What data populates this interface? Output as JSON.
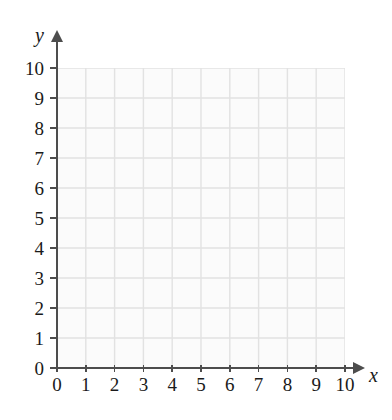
{
  "chart_data": {
    "type": "scatter",
    "title": "",
    "subtitle": "",
    "xlabel": "x",
    "ylabel": "y",
    "xlim": [
      0,
      10
    ],
    "ylim": [
      0,
      10
    ],
    "x_ticks": [
      0,
      1,
      2,
      3,
      4,
      5,
      6,
      7,
      8,
      9,
      10
    ],
    "y_ticks": [
      0,
      1,
      2,
      3,
      4,
      5,
      6,
      7,
      8,
      9,
      10
    ],
    "x_tick_labels": [
      "0",
      "1",
      "2",
      "3",
      "4",
      "5",
      "6",
      "7",
      "8",
      "9",
      "10"
    ],
    "y_tick_labels": [
      "0",
      "1",
      "2",
      "3",
      "4",
      "5",
      "6",
      "7",
      "8",
      "9",
      "10"
    ],
    "grid": true,
    "grid_spacing": 1,
    "legend": false,
    "legend_position": "none",
    "series": [],
    "values": [],
    "annotations": []
  },
  "axes": {
    "x_label": "x",
    "y_label": "y",
    "x_arrow_icon": "arrow-right-icon",
    "y_arrow_icon": "arrow-up-icon"
  },
  "colors": {
    "axis": "#4d4d4d",
    "grid_line": "#e2e2e2",
    "grid_fill": "#fbfbfb",
    "text": "#1a1a1a",
    "background": "#ffffff"
  }
}
